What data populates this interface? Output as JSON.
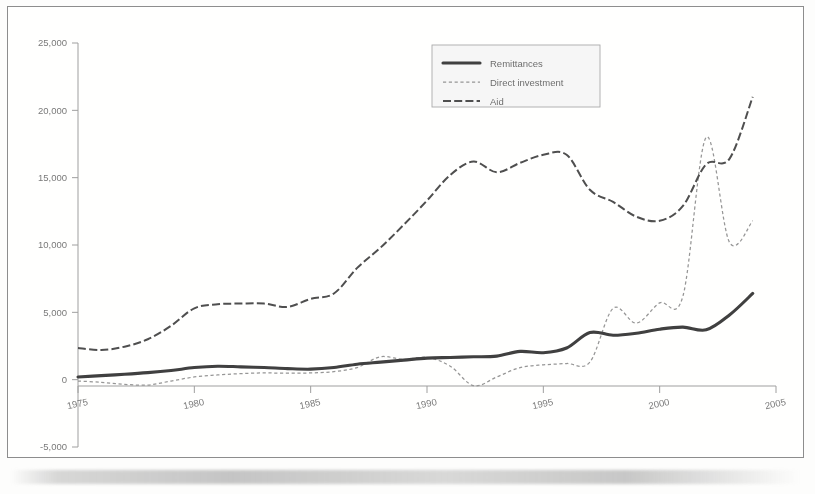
{
  "figure": {
    "frame_visible": true,
    "background_color": "#fffffe",
    "border_color": "#8d8d8d"
  },
  "legend": {
    "position": "top-right",
    "entries": [
      {
        "label": "Remittances",
        "style": "solid-thick",
        "color": "#2b2b2b"
      },
      {
        "label": "Direct investment",
        "style": "fine-dotted",
        "color": "#8f8f8f"
      },
      {
        "label": "Aid",
        "style": "dashed",
        "color": "#3c3c3c"
      }
    ]
  },
  "chart_data": {
    "type": "line",
    "title": "",
    "subtitle": "",
    "xlabel": "",
    "ylabel": "",
    "xlim": [
      1975,
      2005
    ],
    "ylim": [
      -5000,
      25000
    ],
    "xticks": [
      1975,
      1980,
      1985,
      1990,
      1995,
      2000,
      2005
    ],
    "xtick_labels": [
      "1975",
      "1980",
      "1985",
      "1990",
      "1995",
      "2000",
      "2005"
    ],
    "yticks": [
      -5000,
      0,
      5000,
      10000,
      15000,
      20000,
      25000
    ],
    "ytick_labels": [
      "-5,000",
      "0",
      "5,000",
      "10,000",
      "15,000",
      "20,000",
      "25,000"
    ],
    "grid": false,
    "zero_line": true,
    "legend_position": "top-right",
    "x": [
      1975,
      1976,
      1977,
      1978,
      1979,
      1980,
      1981,
      1982,
      1983,
      1984,
      1985,
      1986,
      1987,
      1988,
      1989,
      1990,
      1991,
      1992,
      1993,
      1994,
      1995,
      1996,
      1997,
      1998,
      1999,
      2000,
      2001,
      2002,
      2003,
      2004
    ],
    "series": [
      {
        "name": "Remittances",
        "color": "#2b2b2b",
        "style": "solid-thick",
        "values": [
          200,
          300,
          400,
          520,
          680,
          900,
          1000,
          950,
          900,
          820,
          780,
          900,
          1150,
          1300,
          1450,
          1600,
          1650,
          1700,
          1750,
          2100,
          2000,
          2350,
          3500,
          3300,
          3450,
          3750,
          3900,
          3700,
          4800,
          6400
        ]
      },
      {
        "name": "Direct investment",
        "color": "#8f8f8f",
        "style": "fine-dotted",
        "values": [
          -100,
          -200,
          -350,
          -400,
          -100,
          200,
          350,
          450,
          500,
          480,
          500,
          600,
          900,
          1700,
          1500,
          1650,
          1000,
          -450,
          200,
          900,
          1100,
          1200,
          1300,
          5300,
          4200,
          5700,
          6200,
          18000,
          10200,
          11800
        ]
      },
      {
        "name": "Aid",
        "color": "#3c3c3c",
        "style": "dashed",
        "values": [
          2350,
          2200,
          2450,
          3000,
          4000,
          5300,
          5600,
          5650,
          5650,
          5400,
          6000,
          6400,
          8300,
          9800,
          11500,
          13300,
          15200,
          16200,
          15400,
          16100,
          16700,
          16700,
          14100,
          13200,
          12100,
          11800,
          12900,
          16000,
          16400,
          21000
        ]
      }
    ]
  }
}
